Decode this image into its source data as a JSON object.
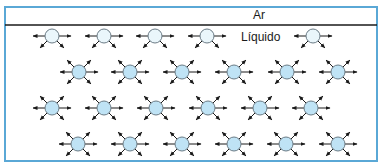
{
  "labels": {
    "air": "Ar",
    "liquid": "Líquido"
  },
  "colors": {
    "frame": "#5aa8d6",
    "separator": "#1a1a1a",
    "molecule_fill": "#bfe3f5",
    "surface_molecule_fill": "#eaf6fb",
    "molecule_stroke": "#6b7b85",
    "arrow": "#1a1a1a"
  },
  "diagram": {
    "frame": {
      "x": 5,
      "y": 7,
      "w": 372,
      "h": 154
    },
    "separator_y": 25,
    "surface_row": {
      "y": 36,
      "x": [
        52,
        104,
        155,
        207,
        313
      ],
      "arrows": [
        "w",
        "e",
        "sw",
        "se"
      ]
    },
    "bulk_rows": [
      {
        "y": 72,
        "x": [
          79,
          130,
          182,
          234,
          287,
          338
        ]
      },
      {
        "y": 108,
        "x": [
          52,
          104,
          156,
          208,
          260,
          311
        ]
      },
      {
        "y": 144,
        "x": [
          78,
          130,
          182,
          234,
          286,
          338
        ]
      }
    ],
    "bulk_arrows": [
      "w",
      "e",
      "nw",
      "ne",
      "sw",
      "se"
    ],
    "molecule_radius": 7
  }
}
